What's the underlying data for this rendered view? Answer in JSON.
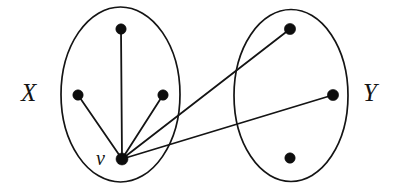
{
  "figure": {
    "type": "bipartite-graph-diagram",
    "background_color": "#ffffff",
    "ink_color": "#141414",
    "width": 404,
    "height": 192
  },
  "labels": {
    "left_set": "X",
    "right_set": "Y",
    "focus_vertex": "v"
  },
  "groups": [
    {
      "id": "X",
      "label": "X",
      "ellipse": {
        "cx": 120.5,
        "cy": 94.5,
        "rx": 59.5,
        "ry": 87.5
      }
    },
    {
      "id": "Y",
      "label": "Y",
      "ellipse": {
        "cx": 291,
        "cy": 95.5,
        "rx": 57,
        "ry": 86
      }
    }
  ],
  "vertices": [
    {
      "id": "x_top",
      "group": "X",
      "cx": 121,
      "cy": 29,
      "r": 5.2,
      "label": ""
    },
    {
      "id": "x_left",
      "group": "X",
      "cx": 78,
      "cy": 95,
      "r": 5.2,
      "label": ""
    },
    {
      "id": "x_right",
      "group": "X",
      "cx": 163,
      "cy": 95,
      "r": 5.2,
      "label": ""
    },
    {
      "id": "v",
      "group": "X",
      "cx": 122,
      "cy": 159,
      "r": 6.0,
      "label": "v"
    },
    {
      "id": "y_top",
      "group": "Y",
      "cx": 290,
      "cy": 29,
      "r": 5.6,
      "label": ""
    },
    {
      "id": "y_mid",
      "group": "Y",
      "cx": 333,
      "cy": 95,
      "r": 5.6,
      "label": ""
    },
    {
      "id": "y_bottom",
      "group": "Y",
      "cx": 290,
      "cy": 158,
      "r": 5.2,
      "label": ""
    }
  ],
  "edges": [
    {
      "id": "e1",
      "from": "v",
      "to": "x_top",
      "x1": 122,
      "y1": 159,
      "x2": 121,
      "y2": 29
    },
    {
      "id": "e2",
      "from": "v",
      "to": "x_left",
      "x1": 122,
      "y1": 159,
      "x2": 78,
      "y2": 95
    },
    {
      "id": "e3",
      "from": "v",
      "to": "x_right",
      "x1": 122,
      "y1": 159,
      "x2": 163,
      "y2": 95
    },
    {
      "id": "e4",
      "from": "v",
      "to": "y_top",
      "x1": 122,
      "y1": 159,
      "x2": 290,
      "y2": 29
    },
    {
      "id": "e5",
      "from": "v",
      "to": "y_mid",
      "x1": 122,
      "y1": 159,
      "x2": 333,
      "y2": 95
    }
  ]
}
